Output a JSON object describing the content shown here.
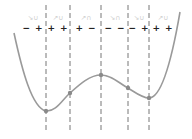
{
  "diagram": {
    "type": "sign-chart-of-polynomial",
    "colors": {
      "curve": "#9a9a9a",
      "dashed_line": "#777777",
      "point": "#8a8a8a",
      "sign_text": "#222222",
      "shape_icon": "#cfcfcf"
    },
    "critical_x": [
      46,
      70,
      101,
      128,
      149
    ],
    "critical_points": [
      {
        "x": 46,
        "y": 111,
        "kind": "local-minimum"
      },
      {
        "x": 70,
        "y": 93,
        "kind": "inflection"
      },
      {
        "x": 101,
        "y": 75,
        "kind": "local-maximum"
      },
      {
        "x": 128,
        "y": 88,
        "kind": "inflection"
      },
      {
        "x": 149,
        "y": 98,
        "kind": "local-minimum"
      }
    ],
    "intervals": [
      {
        "center_x": 33,
        "signs": "− +",
        "shape": "↘︎∪"
      },
      {
        "center_x": 58,
        "signs": "+ +",
        "shape": "↗︎∪"
      },
      {
        "center_x": 86,
        "signs": "+ −",
        "shape": "↗︎∩"
      },
      {
        "center_x": 115,
        "signs": "− −",
        "shape": "↘︎∩"
      },
      {
        "center_x": 139,
        "signs": "− +",
        "shape": "↘︎∪"
      },
      {
        "center_x": 163,
        "signs": "+ +",
        "shape": "↗︎∪"
      }
    ]
  }
}
